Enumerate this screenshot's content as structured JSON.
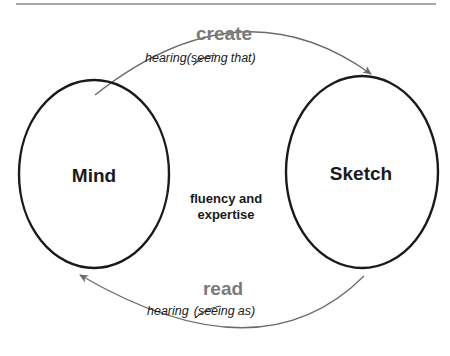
{
  "diagram": {
    "nodes": [
      {
        "id": "mind",
        "label": "Mind"
      },
      {
        "id": "sketch",
        "label": "Sketch"
      }
    ],
    "center_label": {
      "line1": "fluency and",
      "line2": "expertise"
    },
    "top_arrow": {
      "title": "create",
      "subtitle_prefix": "hearing",
      "subtitle_struck": "seeing",
      "subtitle_suffix": "that)",
      "open_paren": "(",
      "from": "mind",
      "to": "sketch"
    },
    "bottom_arrow": {
      "title": "read",
      "subtitle_prefix": "hearing",
      "subtitle_struck": "seeing",
      "subtitle_suffix": "as)",
      "open_paren": "(",
      "from": "sketch",
      "to": "mind"
    },
    "colors": {
      "ellipse": "#1a1a1a",
      "arrow": "#6b6b6b",
      "arrow_title": "#7a7a7a",
      "text": "#1a1a1a",
      "rule": "#8a8a8a"
    }
  }
}
